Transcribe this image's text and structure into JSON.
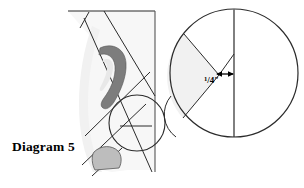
{
  "figure": {
    "caption": "Diagram 5",
    "dimension_callout": {
      "numerator": "1",
      "slash": "/",
      "denominator": "4",
      "unit": "\"",
      "full_text": "1/4\""
    },
    "colors": {
      "stroke": "#2b2b2b",
      "stroke_light": "#555555",
      "panel_fill": "#f7f7f7",
      "wedge_fill": "#f1f1f1",
      "ear_fill": "#7d7d7d",
      "ear_inner_fill": "#e8e8e8",
      "blob_fill": "#bdbdbd",
      "background": "#ffffff",
      "text": "#000000"
    },
    "elements": {
      "head_panel": "head-profile-panel",
      "ear": "ear-shape",
      "section_lines": "sectioning-guide-lines",
      "detail_circle": "detail-callout-circle",
      "vertical_guide": "vertical-center-guide",
      "magnified_view": "magnified-detail-circle",
      "wedge": "shaded-sector-wedge",
      "chord": "vertical-chord-line",
      "dimension_arrow": "double-headed-dimension-arrow"
    }
  }
}
